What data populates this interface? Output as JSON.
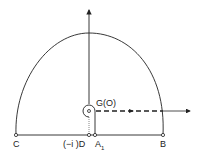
{
  "diagram": {
    "type": "contour-integration-path",
    "labels": {
      "g_origin": "G(O)",
      "point_c": "C",
      "point_d": "(−i )D",
      "point_a1": "A",
      "point_a1_sub": "1",
      "point_b": "B"
    },
    "colors": {
      "stroke": "#222222",
      "background": "#ffffff"
    }
  }
}
